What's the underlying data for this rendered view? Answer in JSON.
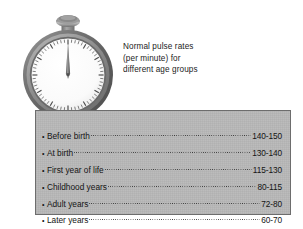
{
  "figure": {
    "caption_lines": [
      "Normal pulse rates",
      "(per minute) for",
      "different age groups"
    ]
  },
  "illustration": {
    "device": "stopwatch",
    "dial_reading": "12 o'clock",
    "bezel_color": "#6e6e6e",
    "dial_color": "#fbfbfb",
    "crown_color": "#8d8d8d"
  },
  "panel": {
    "background_color": "#b9b9b9",
    "border_color": "#6d6d6d",
    "bullet": "•",
    "rows": [
      {
        "label": "Before birth",
        "value": "140-150"
      },
      {
        "label": "At birth",
        "value": "130-140"
      },
      {
        "label": "First year of life",
        "value": "115-130"
      },
      {
        "label": "Childhood years",
        "value": "80-115"
      },
      {
        "label": "Adult years",
        "value": "72-80"
      },
      {
        "label": "Later years",
        "value": "60-70"
      }
    ]
  },
  "chart_data": {
    "type": "table",
    "title": "Normal pulse rates (per minute) for different age groups",
    "xlabel": "Age group",
    "ylabel": "Pulse rate (beats per minute)",
    "categories": [
      "Before birth",
      "At birth",
      "First year of life",
      "Childhood years",
      "Adult years",
      "Later years"
    ],
    "value_labels": [
      "140-150",
      "130-140",
      "115-130",
      "80-115",
      "72-80",
      "60-70"
    ],
    "low": [
      140,
      130,
      115,
      80,
      72,
      60
    ],
    "high": [
      150,
      140,
      130,
      115,
      80,
      70
    ],
    "units": "beats per minute",
    "grid": false,
    "legend": "none"
  }
}
